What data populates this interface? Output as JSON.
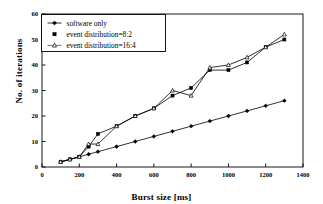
{
  "figure": {
    "background": "#ffffff",
    "frame_color": "#000000"
  },
  "chart_data": {
    "type": "line",
    "title": "",
    "xlabel": "Burst size [ms]",
    "ylabel": "No. of iterations",
    "xlim": [
      0,
      1400
    ],
    "ylim": [
      0,
      60
    ],
    "xticks": [
      0,
      200,
      400,
      600,
      800,
      1000,
      1200,
      1400
    ],
    "xtick_labels": [
      "0",
      "200",
      "400",
      "600",
      "800",
      "1000",
      "1200",
      "1400"
    ],
    "yticks": [
      0,
      10,
      20,
      30,
      40,
      50,
      60
    ],
    "ytick_labels": [
      "0",
      "10",
      "20",
      "30",
      "40",
      "50",
      "60"
    ],
    "grid": false,
    "legend_position": "upper-left",
    "series": [
      {
        "name": "software only",
        "marker": "diamond-filled",
        "color": "#000000",
        "x": [
          100,
          150,
          200,
          250,
          300,
          400,
          500,
          600,
          700,
          800,
          900,
          1000,
          1100,
          1200,
          1300
        ],
        "y": [
          2,
          3,
          4,
          5,
          6,
          8,
          10,
          12,
          14,
          16,
          18,
          20,
          22,
          24,
          26
        ]
      },
      {
        "name": "event distribution=8:2",
        "marker": "square-filled",
        "color": "#000000",
        "x": [
          100,
          150,
          200,
          250,
          300,
          400,
          500,
          600,
          700,
          800,
          900,
          1000,
          1100,
          1200,
          1300
        ],
        "y": [
          2,
          3,
          4,
          8,
          13,
          16,
          20,
          23,
          28,
          31,
          38,
          38,
          41,
          47,
          50
        ]
      },
      {
        "name": "event distribution=16:4",
        "marker": "triangle-open",
        "color": "#000000",
        "x": [
          100,
          150,
          200,
          250,
          300,
          400,
          500,
          600,
          700,
          800,
          900,
          1000,
          1100,
          1200,
          1300
        ],
        "y": [
          2,
          3,
          4,
          9,
          9,
          16,
          20,
          23,
          30,
          28,
          39,
          40,
          43,
          47,
          52
        ]
      }
    ]
  },
  "legend": {
    "items": [
      {
        "label": "software only",
        "marker": "diamond-filled"
      },
      {
        "label": "event distribution=8:2",
        "marker": "square-filled"
      },
      {
        "label": "event distribution=16:4",
        "marker": "triangle-open"
      }
    ]
  }
}
